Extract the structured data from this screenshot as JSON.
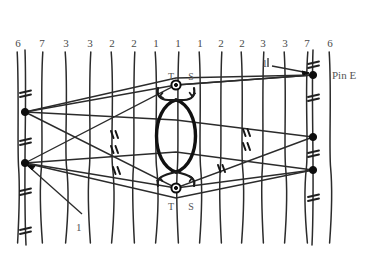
{
  "figure": {
    "type": "technical-line-diagram"
  },
  "columns": {
    "labels": [
      "6",
      "7",
      "3",
      "3",
      "2",
      "2",
      "1",
      "1",
      "1",
      "2",
      "2",
      "3",
      "3",
      "7",
      "6"
    ],
    "x": [
      18,
      42,
      66,
      90,
      112,
      134,
      156,
      178,
      200,
      221,
      242,
      263,
      285,
      307,
      330
    ],
    "top_y": 38
  },
  "annotations": {
    "top_center": {
      "t": "T",
      "s": "S",
      "x_t": 166,
      "x_s": 186,
      "y": 72
    },
    "bottom_center": {
      "t": "T",
      "s": "S",
      "x_t": 166,
      "x_s": 186,
      "y": 202
    },
    "pin": {
      "label": "Pin E",
      "x": 332,
      "y": 70
    },
    "lead_right": {
      "label": "1",
      "x": 262,
      "y": 58
    },
    "lead_bottom_left": {
      "label": "1",
      "x": 76,
      "y": 222
    }
  },
  "nodes": {
    "left": [
      {
        "x": 25,
        "y": 112,
        "kind": "dot"
      },
      {
        "x": 25,
        "y": 163,
        "kind": "dot"
      }
    ],
    "right": [
      {
        "x": 313,
        "y": 75,
        "kind": "dot"
      },
      {
        "x": 313,
        "y": 137,
        "kind": "dot"
      },
      {
        "x": 313,
        "y": 170,
        "kind": "dot"
      }
    ],
    "center": [
      {
        "x": 176,
        "y": 85,
        "kind": "ring"
      },
      {
        "x": 176,
        "y": 188,
        "kind": "ring"
      }
    ]
  },
  "loop": {
    "center_x": 176,
    "top_y": 100,
    "bottom_y": 172,
    "half_width": 26
  },
  "colors": {
    "ink": "#2b2b2b",
    "label": "#555555",
    "background": "#ffffff"
  }
}
